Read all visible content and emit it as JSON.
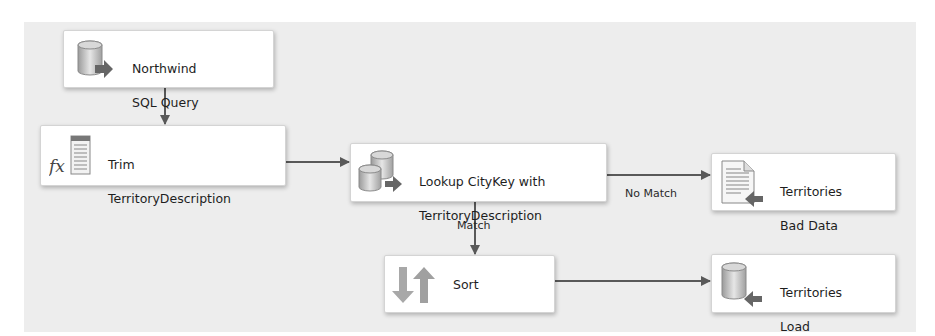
{
  "nodes": {
    "northwind": {
      "label_1": "Northwind",
      "label_2": "SQL Query",
      "icon": "database-source-icon"
    },
    "trim": {
      "label_1": "Trim",
      "label_2": "TerritoryDescription",
      "icon": "derived-column-fx-icon"
    },
    "lookup": {
      "label_1": "Lookup CityKey with",
      "label_2": "TerritoryDescription",
      "icon": "lookup-databases-icon"
    },
    "bad_data": {
      "label_1": "Territories",
      "label_2": "Bad Data",
      "icon": "flat-file-destination-icon"
    },
    "sort": {
      "label_1": "Sort",
      "icon": "sort-arrows-icon"
    },
    "load": {
      "label_1": "Territories",
      "label_2": "Load",
      "icon": "database-destination-icon"
    }
  },
  "links": {
    "no_match": "No Match",
    "match": "Match"
  },
  "colors": {
    "canvas": "#ededed",
    "node_bg": "#ffffff",
    "arrow": "#595959",
    "icon_gray": "#a8a8a8"
  }
}
